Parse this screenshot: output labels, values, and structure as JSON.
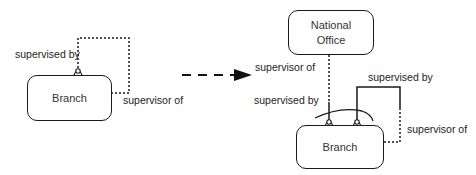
{
  "diagram": {
    "left": {
      "entity": "Branch",
      "role_supervised_by": "supervised by",
      "role_supervisor_of": "supervisor of"
    },
    "transform_arrow": "dashed-arrow",
    "right": {
      "top_entity_line1": "National",
      "top_entity_line2": "Office",
      "bottom_entity": "Branch",
      "role_supervisor_of_national": "supervisor of",
      "role_supervised_by_branch": "supervised by",
      "role_supervised_by_self": "supervised by",
      "role_supervisor_of_self": "supervisor of"
    },
    "colors": {
      "line": "#1a1a1a",
      "text": "#222222"
    }
  }
}
